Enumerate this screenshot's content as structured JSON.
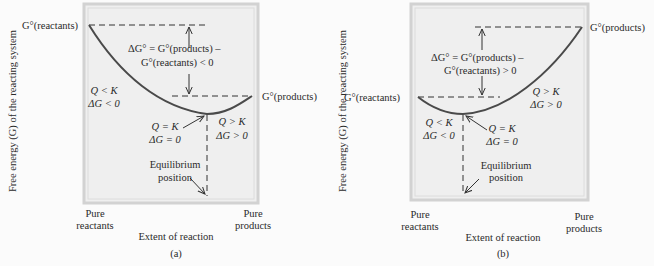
{
  "panels": [
    {
      "id": "a",
      "caption": "(a)",
      "y_axis_label": "Free energy (G) of the reacting system",
      "x_axis_label": "Extent of reaction",
      "x_left_label": [
        "Pure",
        "reactants"
      ],
      "x_right_label": [
        "Pure",
        "products"
      ],
      "g_reactants_label": "G°(reactants)",
      "g_products_label": "G°(products)",
      "delta_g_line1": "ΔG° = G°(products) –",
      "delta_g_line2": "G°(reactants) < 0",
      "left_region": [
        "Q < K",
        "ΔG < 0"
      ],
      "right_region": [
        "Q > K",
        "ΔG > 0"
      ],
      "minimum_label": [
        "Q = K",
        "ΔG = 0"
      ],
      "equilibrium_label": [
        "Equilibrium",
        "position"
      ]
    },
    {
      "id": "b",
      "caption": "(b)",
      "y_axis_label": "Free energy (G) of the reacting system",
      "x_axis_label": "Extent of reaction",
      "x_left_label": [
        "Pure",
        "reactants"
      ],
      "x_right_label": [
        "Pure",
        "products"
      ],
      "g_reactants_label": "G°(reactants)",
      "g_products_label": "G°(products)",
      "delta_g_line1": "ΔG° = G°(products) –",
      "delta_g_line2": "G°(reactants) > 0",
      "left_region": [
        "Q < K",
        "ΔG < 0"
      ],
      "right_region": [
        "Q > K",
        "ΔG > 0"
      ],
      "minimum_label": [
        "Q = K",
        "ΔG = 0"
      ],
      "equilibrium_label": [
        "Equilibrium",
        "position"
      ]
    }
  ],
  "colors": {
    "curve": "#4a4a4a",
    "panel_fill": "#efefef",
    "panel_border": "#d4d4d4",
    "text": "#2a2a2a"
  }
}
